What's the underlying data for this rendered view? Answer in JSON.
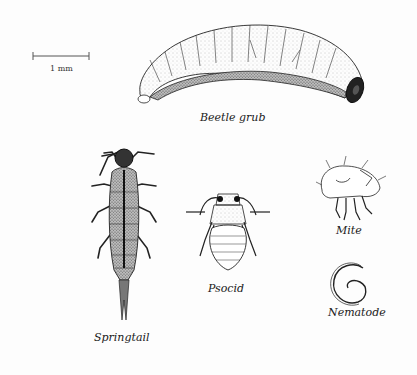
{
  "scale_bar": {
    "label": "1 mm"
  },
  "organisms": [
    {
      "name": "beetle-grub",
      "label": "Beetle grub"
    },
    {
      "name": "springtail",
      "label": "Springtail"
    },
    {
      "name": "psocid",
      "label": "Psocid"
    },
    {
      "name": "mite",
      "label": "Mite"
    },
    {
      "name": "nematode",
      "label": "Nematode"
    }
  ],
  "colors": {
    "background": "#fdfdfd",
    "ink": "#1a1a1a",
    "stipple": "#888888"
  }
}
